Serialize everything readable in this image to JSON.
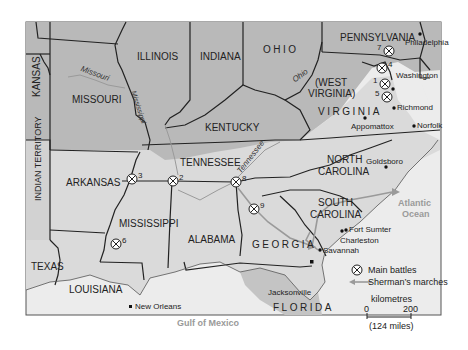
{
  "map": {
    "colors": {
      "union": "#b9b9b9",
      "confederate": "#dadada",
      "sea": "#ececec",
      "border": "#222222",
      "march": "#9a9a9a",
      "water_label": "#9a9a9a"
    },
    "states": {
      "kansas": "KANSAS",
      "missouri": "MISSOURI",
      "illinois": "ILLINOIS",
      "indiana": "INDIANA",
      "ohio": "OHIO",
      "pennsylvania": "PENNSYLVANIA",
      "west_virginia_1": "(WEST",
      "west_virginia_2": "VIRGINIA)",
      "virginia": "VIRGINIA",
      "kentucky": "KENTUCKY",
      "tennessee": "TENNESSEE",
      "north_carolina_1": "NORTH",
      "north_carolina_2": "CAROLINA",
      "south_carolina_1": "SOUTH",
      "south_carolina_2": "CAROLINA",
      "indian_territory": "INDIAN TERRITORY",
      "arkansas": "ARKANSAS",
      "mississippi": "MISSISSIPPI",
      "alabama": "ALABAMA",
      "georgia": "GEORGIA",
      "texas": "TEXAS",
      "louisiana": "LOUISIANA",
      "florida": "FLORIDA"
    },
    "rivers": {
      "missouri": "Missouri",
      "mississippi": "Mississippi",
      "ohio": "Ohio",
      "tennessee": "Tennessee"
    },
    "water": {
      "atlantic_1": "Atlantic",
      "atlantic_2": "Ocean",
      "gulf": "Gulf of Mexico"
    },
    "cities": {
      "philadelphia": "Philadelphia",
      "washington": "Washington",
      "richmond": "Richmond",
      "appomattox": "Appomattox",
      "norfolk": "Norfolk",
      "goldsboro": "Goldsboro",
      "fort_sumter": "Fort Sumter",
      "charleston": "Charleston",
      "savannah": "Savannah",
      "jacksonville": "Jacksonville",
      "new_orleans": "New Orleans"
    },
    "battles": [
      {
        "num": "1",
        "x": 385,
        "y": 84
      },
      {
        "num": "2",
        "x": 173,
        "y": 181
      },
      {
        "num": "3",
        "x": 132,
        "y": 179
      },
      {
        "num": "4",
        "x": 382,
        "y": 68
      },
      {
        "num": "5",
        "x": 387,
        "y": 97
      },
      {
        "num": "6",
        "x": 116,
        "y": 244
      },
      {
        "num": "7",
        "x": 389,
        "y": 51
      },
      {
        "num": "8",
        "x": 236,
        "y": 182
      },
      {
        "num": "9",
        "x": 254,
        "y": 209
      }
    ]
  },
  "legend": {
    "battles_label": "Main battles",
    "marches_label": "Sherman’s marches",
    "scale_unit": "kilometres",
    "scale_start": "0",
    "scale_end": "200",
    "scale_miles": "(124 miles)"
  }
}
